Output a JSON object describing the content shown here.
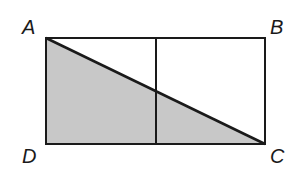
{
  "diagram": {
    "labels": {
      "A": "A",
      "B": "B",
      "C": "C",
      "D": "D"
    },
    "points": {
      "A": [
        46,
        38
      ],
      "B": [
        265,
        38
      ],
      "C": [
        265,
        144
      ],
      "D": [
        46,
        144
      ],
      "mid_top": [
        156,
        38
      ],
      "mid_bottom": [
        156,
        144
      ]
    },
    "colors": {
      "stroke": "#1a1a1a",
      "shade": "#c8c8c8",
      "background": "#ffffff"
    },
    "shaded_region": "triangle ACD"
  }
}
